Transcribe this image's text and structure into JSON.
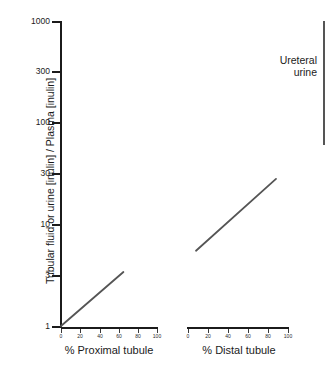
{
  "chart_data": {
    "type": "line",
    "title": "",
    "subtitle": "",
    "ylabel": "Tubular fluid or urine [inulin] / Plasma [inulin]",
    "yscale": "log",
    "ylim": [
      1,
      1000
    ],
    "yticks": [
      1,
      3,
      10,
      30,
      100,
      300,
      1000
    ],
    "ytick_labels": [
      "1",
      "3",
      "10",
      "30",
      "100",
      "300",
      "1000"
    ],
    "grid": false,
    "legend_position": "none",
    "panels": [
      {
        "name": "proximal",
        "xlabel": "% Proximal tubule",
        "xlim": [
          0,
          100
        ],
        "xticks": [
          0,
          20,
          40,
          60,
          80,
          100
        ],
        "xtick_labels": [
          "0",
          "20",
          "40",
          "60",
          "80",
          "100"
        ],
        "series": [
          {
            "name": "Proximal tubule TF/P inulin",
            "x": [
              0,
              65
            ],
            "values": [
              1.0,
              3.4
            ],
            "color": "#555555"
          }
        ]
      },
      {
        "name": "distal",
        "xlabel": "% Distal tubule",
        "xlim": [
          0,
          100
        ],
        "xticks": [
          0,
          20,
          40,
          60,
          80,
          100
        ],
        "xtick_labels": [
          "0",
          "20",
          "40",
          "60",
          "80",
          "100"
        ],
        "series": [
          {
            "name": "Distal tubule TF/P inulin",
            "x": [
              8,
              88
            ],
            "values": [
              5.5,
              28.0
            ],
            "color": "#555555"
          }
        ]
      }
    ],
    "annotations": [
      {
        "name": "ureteral-urine",
        "line1": "Ureteral",
        "line2": "urine",
        "range_low": 60,
        "range_high": 1000,
        "color": "#555555"
      }
    ]
  },
  "colors": {
    "axis": "#1b1b1b",
    "data": "#555555",
    "background": "#ffffff",
    "text": "#1b1b1b"
  }
}
